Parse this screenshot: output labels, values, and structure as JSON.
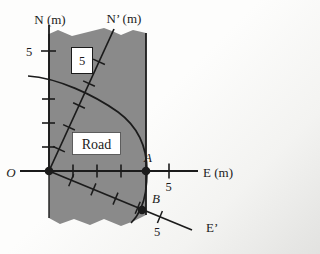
{
  "diagram": {
    "ink_color": "#1b1b1b",
    "road": {
      "label": "Road",
      "fill": "#8a8a8a"
    },
    "axes": {
      "n": {
        "label": "N (m)",
        "tick_label": "5"
      },
      "e": {
        "label": "E (m)",
        "tick_label": "5"
      },
      "n_prime": {
        "label": "N’ (m)",
        "tick_label": "5"
      },
      "e_prime": {
        "label": "E’",
        "tick_label": "5"
      }
    },
    "points": {
      "origin": "O",
      "a": "A",
      "b": "B"
    },
    "tick_value_meters": 5
  }
}
